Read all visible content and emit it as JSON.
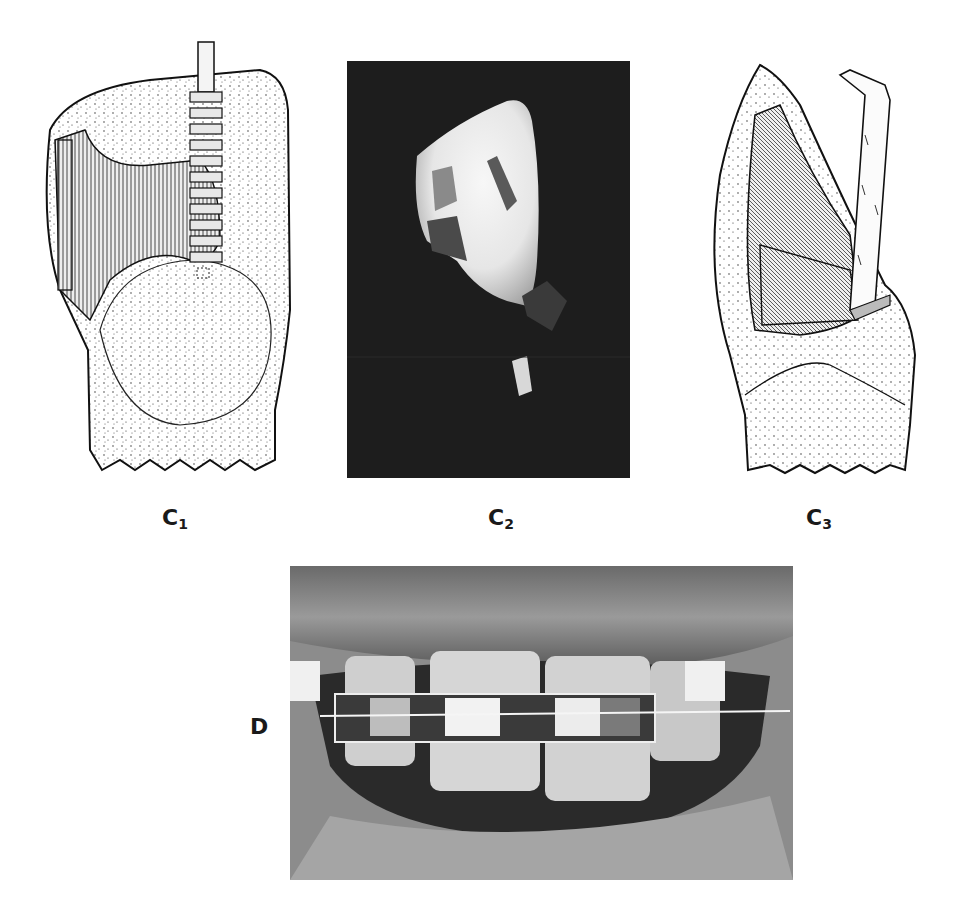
{
  "figure": {
    "panels": [
      {
        "id": "C1",
        "letter": "C",
        "subscript": "1",
        "kind": "line-drawing",
        "description": "Stippled tooth with cut-away preparation and vertical bur instrument"
      },
      {
        "id": "C2",
        "letter": "C",
        "subscript": "2",
        "kind": "photograph",
        "description": "Tooth crown photographed against black background"
      },
      {
        "id": "C3",
        "letter": "C",
        "subscript": "3",
        "kind": "line-drawing",
        "description": "Stippled tooth with preparation cavity and angled chisel instrument"
      },
      {
        "id": "D",
        "letter": "D",
        "subscript": "",
        "kind": "photograph",
        "description": "Close-up of mouth showing front teeth with orthodontic bands and archwire"
      }
    ]
  }
}
